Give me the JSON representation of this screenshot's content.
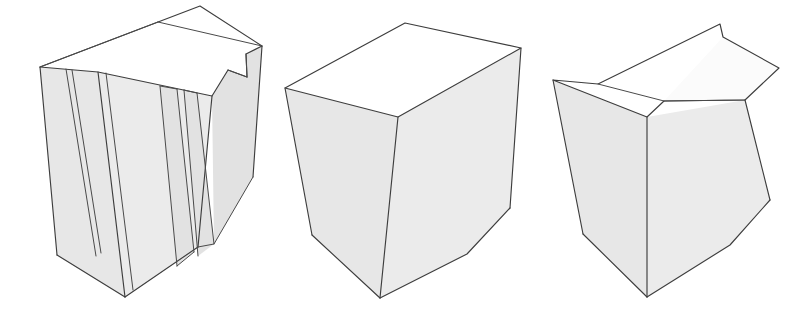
{
  "page": {
    "background_color": "#ffffff",
    "width": 804,
    "height": 317
  },
  "style": {
    "line_color": "#3d3d3d",
    "top_face_color": "#ffffff",
    "left_face_color": "#e7e7e7",
    "right_face_color": "#ebebeb",
    "bevel_face_color": "#fbfbfb"
  },
  "figures": [
    {
      "id": "figure-1",
      "name": "slotted-notched-block",
      "label": "",
      "features": [
        "vertical through slots",
        "stepped corner notch",
        "rectangular prism"
      ],
      "faces": {
        "top": "200,6 158,22 262,45 245,53 246,77 227,70 212,96 98,72 40,67",
        "left": "40,67 98,72 125,297 57,255",
        "right_main": "98,72 212,96 198,247 125,297",
        "slot_a": "66,69 71,69 96,255 91,256",
        "slot_b": "105,73 113,74 131,290 122,291",
        "right_panel_1": "160,86 176,89 194,252 176,265",
        "right_panel_2": "183,90 196,93 213,243 198,255",
        "notch_face": "212,96 227,70 246,77 245,53 262,45 252,176 213,243"
      }
    },
    {
      "id": "figure-2",
      "name": "plain-rectangular-block",
      "label": "",
      "features": [
        "plain rectangular prism",
        "no cuts"
      ],
      "faces": {
        "top": "405,23 285,88 398,117 521,48",
        "left": "285,88 398,117 380,298 312,235",
        "right": "398,117 521,48 510,208 467,254 380,298"
      }
    },
    {
      "id": "figure-3",
      "name": "chamfered-top-block",
      "label": "",
      "features": [
        "chamfered top front edge",
        "rectangular prism"
      ],
      "faces": {
        "top_upper": "720,24 598,84 664,101 723,37",
        "top_front": "598,84 553,80 647,117 664,101",
        "bevel": "664,101 723,37 779,68 745,100",
        "left": "553,80 647,117 647,297 583,234",
        "right": "647,117 745,100 779,68 770,200 730,245 647,297"
      }
    }
  ]
}
